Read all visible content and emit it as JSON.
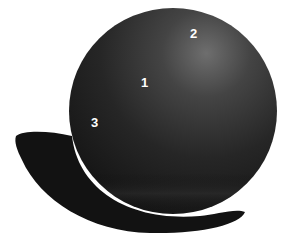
{
  "figure": {
    "labels": [
      {
        "text": "1",
        "x": 140,
        "y": 76
      },
      {
        "text": "2",
        "x": 190,
        "y": 27
      },
      {
        "text": "3",
        "x": 90,
        "y": 116
      }
    ],
    "colors": {
      "background": "#ffffff",
      "sphere_dark": "#161616",
      "sphere_mid": "#3a3a3a",
      "highlight": "#6e6e6e",
      "shadow": "#121212",
      "label": "#ffffff"
    }
  }
}
